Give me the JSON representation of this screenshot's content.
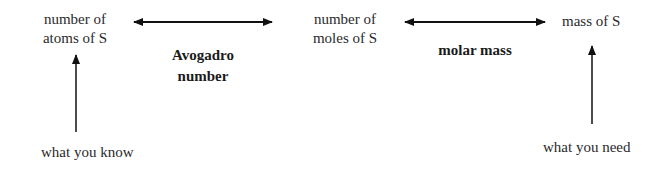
{
  "nodes": {
    "atoms": {
      "line1": "number of",
      "line2": "atoms of S"
    },
    "moles": {
      "line1": "number of",
      "line2": "moles of S"
    },
    "mass": {
      "line1": "mass of S"
    }
  },
  "edges": {
    "atoms_moles": {
      "label_line1": "Avogadro",
      "label_line2": "number"
    },
    "moles_mass": {
      "label": "molar mass"
    }
  },
  "annotations": {
    "know": "what you know",
    "need": "what you need"
  },
  "colors": {
    "line": "#111111",
    "text": "#2a2a2a"
  }
}
